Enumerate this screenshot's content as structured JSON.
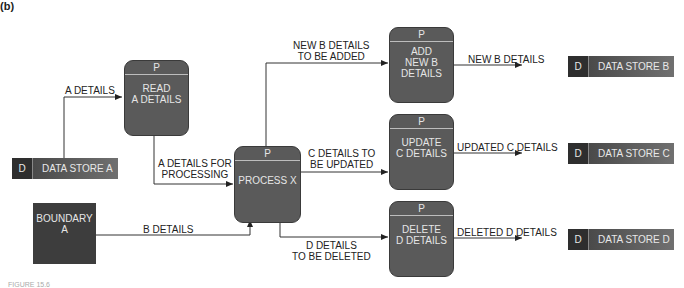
{
  "panel_label": "(b)",
  "caption": "FIGURE 15.6",
  "processes": [
    {
      "id": "read-a",
      "tag": "P",
      "name": "READ\nA DETAILS"
    },
    {
      "id": "process-x",
      "tag": "P",
      "name": "PROCESS X"
    },
    {
      "id": "add-b",
      "tag": "P",
      "name": "ADD\nNEW B\nDETAILS"
    },
    {
      "id": "update-c",
      "tag": "P",
      "name": "UPDATE\nC DETAILS"
    },
    {
      "id": "delete-d",
      "tag": "P",
      "name": "DELETE\nD DETAILS"
    }
  ],
  "stores": [
    {
      "id": "a",
      "tag": "D",
      "name": "DATA STORE A"
    },
    {
      "id": "b",
      "tag": "D",
      "name": "DATA STORE B"
    },
    {
      "id": "c",
      "tag": "D",
      "name": "DATA STORE C"
    },
    {
      "id": "d",
      "tag": "D",
      "name": "DATA STORE D"
    }
  ],
  "boundary": {
    "name": "BOUNDARY\nA"
  },
  "flows": {
    "a_details": "A DETAILS",
    "a_for_processing": "A DETAILS FOR\nPROCESSING",
    "b_details": "B DETAILS",
    "new_b_to_add": "NEW B DETAILS\nTO BE ADDED",
    "c_to_update": "C DETAILS TO\nBE UPDATED",
    "d_to_delete": "D DETAILS\nTO BE DELETED",
    "new_b": "NEW B DETAILS",
    "updated_c": "UPDATED C DETAILS",
    "deleted_d": "DELETED D DETAILS"
  }
}
